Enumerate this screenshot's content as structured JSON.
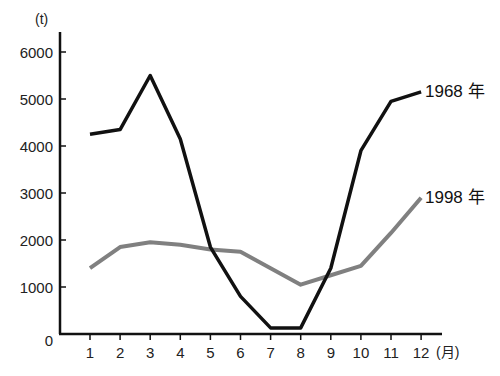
{
  "chart_data": {
    "type": "line",
    "title": "",
    "xlabel": "(月)",
    "ylabel": "(t)",
    "x": [
      1,
      2,
      3,
      4,
      5,
      6,
      7,
      8,
      9,
      10,
      11,
      12
    ],
    "categories": [
      "1",
      "2",
      "3",
      "4",
      "5",
      "6",
      "7",
      "8",
      "9",
      "10",
      "11",
      "12"
    ],
    "ylim": [
      0,
      6000
    ],
    "yticks": [
      0,
      1000,
      2000,
      3000,
      4000,
      5000,
      6000
    ],
    "grid": false,
    "legend_position": "inline-right",
    "series": [
      {
        "name": "1968年",
        "color": "#111111",
        "values": [
          4250,
          4350,
          5500,
          4150,
          1850,
          800,
          130,
          130,
          1400,
          3900,
          4950,
          5150
        ]
      },
      {
        "name": "1998年",
        "color": "#808080",
        "values": [
          1400,
          1850,
          1950,
          1900,
          1800,
          1750,
          1400,
          1050,
          1250,
          1450,
          2150,
          2900
        ]
      }
    ]
  },
  "axis": {
    "y_unit": "(t)",
    "x_unit": "(月)",
    "y_tick_labels": [
      "0",
      "1000",
      "2000",
      "3000",
      "4000",
      "5000",
      "6000"
    ],
    "x_tick_labels": [
      "1",
      "2",
      "3",
      "4",
      "5",
      "6",
      "7",
      "8",
      "9",
      "10",
      "11",
      "12"
    ]
  },
  "labels": {
    "series_1968": "1968 年",
    "series_1998": "1998 年"
  }
}
